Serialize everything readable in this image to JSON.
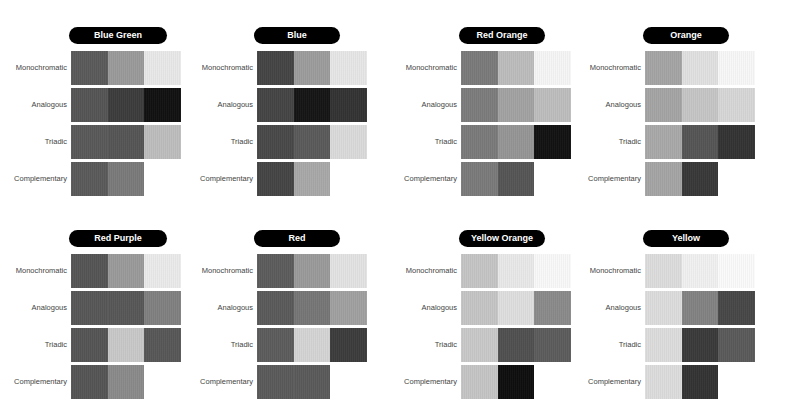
{
  "chart_data": {
    "type": "heatmap",
    "title": "",
    "row_labels": [
      "Monochromatic",
      "Analogous",
      "Triadic",
      "Complementary"
    ],
    "panels": [
      {
        "name": "Blue Green",
        "rows": [
          [
            "#5a5a5a",
            "#9a9a9a",
            "#e8e8e8"
          ],
          [
            "#555555",
            "#3c3c3c",
            "#111111"
          ],
          [
            "#595959",
            "#555555",
            "#bdbdbd"
          ],
          [
            "#5a5a5a",
            "#7a7a7a"
          ]
        ]
      },
      {
        "name": "Blue",
        "rows": [
          [
            "#444444",
            "#9c9c9c",
            "#e6e6e6"
          ],
          [
            "#444444",
            "#151515",
            "#333333"
          ],
          [
            "#484848",
            "#5a5a5a",
            "#dadada"
          ],
          [
            "#444444",
            "#a8a8a8"
          ]
        ]
      },
      {
        "name": "Red Orange",
        "rows": [
          [
            "#7a7a7a",
            "#bcbcbc",
            "#f5f5f5"
          ],
          [
            "#7c7c7c",
            "#a2a2a2",
            "#bdbdbd"
          ],
          [
            "#7a7a7a",
            "#959595",
            "#121212"
          ],
          [
            "#7a7a7a",
            "#555555"
          ]
        ]
      },
      {
        "name": "Orange",
        "rows": [
          [
            "#a4a4a4",
            "#e0e0e0",
            "#f7f7f7"
          ],
          [
            "#a4a4a4",
            "#c5c5c5",
            "#d6d6d6"
          ],
          [
            "#a8a8a8",
            "#555555",
            "#333333"
          ],
          [
            "#a4a4a4",
            "#383838"
          ]
        ]
      },
      {
        "name": "Red Purple",
        "rows": [
          [
            "#555555",
            "#9a9a9a",
            "#eaeaea"
          ],
          [
            "#575757",
            "#575757",
            "#808080"
          ],
          [
            "#555555",
            "#c8c8c8",
            "#575757"
          ],
          [
            "#555555",
            "#8a8a8a"
          ]
        ]
      },
      {
        "name": "Red",
        "rows": [
          [
            "#5c5c5c",
            "#9a9a9a",
            "#e2e2e2"
          ],
          [
            "#5a5a5a",
            "#767676",
            "#a0a0a0"
          ],
          [
            "#5c5c5c",
            "#d4d4d4",
            "#3c3c3c"
          ],
          [
            "#5a5a5a",
            "#5a5a5a"
          ]
        ]
      },
      {
        "name": "Yellow Orange",
        "rows": [
          [
            "#c4c4c4",
            "#e8e8e8",
            "#f8f8f8"
          ],
          [
            "#c4c4c4",
            "#dedede",
            "#8a8a8a"
          ],
          [
            "#c8c8c8",
            "#505050",
            "#5c5c5c"
          ],
          [
            "#c4c4c4",
            "#0e0e0e"
          ]
        ]
      },
      {
        "name": "Yellow",
        "rows": [
          [
            "#dcdcdc",
            "#f0f0f0",
            "#fafafa"
          ],
          [
            "#dcdcdc",
            "#828282",
            "#474747"
          ],
          [
            "#dcdcdc",
            "#3a3a3a",
            "#5a5a5a"
          ],
          [
            "#dcdcdc",
            "#333333"
          ]
        ]
      }
    ]
  },
  "panels": [
    {
      "title": "Blue Green"
    },
    {
      "title": "Blue"
    },
    {
      "title": "Red Orange"
    },
    {
      "title": "Orange"
    },
    {
      "title": "Red Purple"
    },
    {
      "title": "Red"
    },
    {
      "title": "Yellow Orange"
    },
    {
      "title": "Yellow"
    }
  ],
  "labels": {
    "monochromatic": "Monochromatic",
    "analogous": "Analogous",
    "triadic": "Triadic",
    "complementary": "Complementary"
  }
}
